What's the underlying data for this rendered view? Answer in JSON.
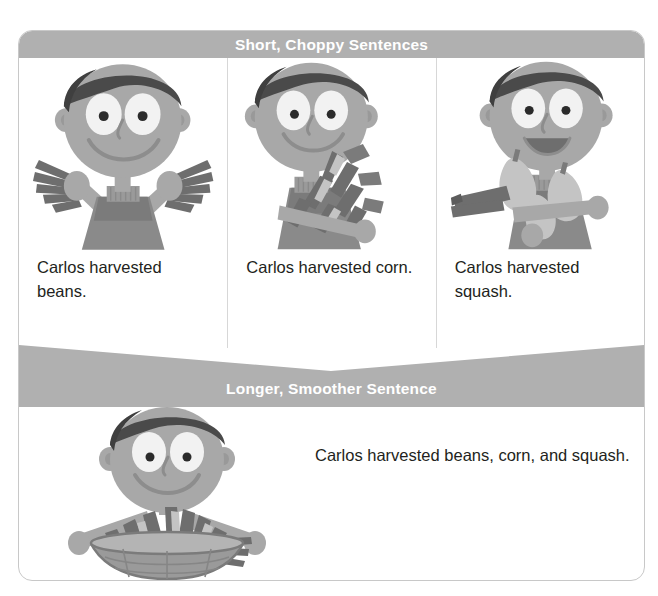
{
  "figure": {
    "type": "instructional-comparison-graphic"
  },
  "sections": {
    "top": {
      "banner_label": "Short, Choppy Sentences",
      "panels": [
        {
          "id": "beans",
          "caption": "Carlos harvested beans.",
          "art_name": "boy-holding-beans-illustration",
          "art_description": "Smiling boy with both arms raised holding bean pods"
        },
        {
          "id": "corn",
          "caption": "Carlos harvested corn.",
          "art_name": "boy-holding-corn-illustration",
          "art_description": "Smiling boy cradling an armful of corn ears"
        },
        {
          "id": "squash",
          "caption": "Carlos harvested squash.",
          "art_name": "boy-holding-squash-illustration",
          "art_description": "Boy with open mouth holding squash gourds"
        }
      ]
    },
    "bottom": {
      "banner_label": "Longer, Smoother Sentence",
      "caption": "Carlos harvested beans, corn, and squash.",
      "art_name": "boy-holding-basket-illustration",
      "art_description": "Smiling boy holding a basket filled with beans, corn, and squash"
    }
  },
  "colors": {
    "banner_fill": "#b0b0b0",
    "banner_text": "#ffffff",
    "card_border": "#c8c8c8",
    "divider": "#d7d7d7",
    "caption_text": "#231f20",
    "skin": "#a8a8a8",
    "skin_shadow": "#999999",
    "hair": "#4a4a4a",
    "shirt": "#8a8a8a",
    "shirt_dark": "#7b7b7b",
    "produce_dark": "#6e6e6e",
    "produce_light": "#c4c4c4",
    "basket": "#9a9a9a",
    "eye_white": "#f2f2f2",
    "pupil": "#2b2b2b"
  }
}
